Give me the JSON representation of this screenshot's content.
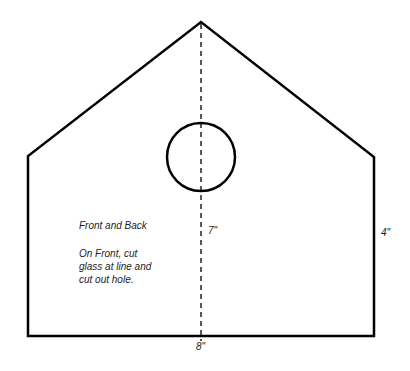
{
  "diagram": {
    "shape": {
      "outline_points": [
        [
          28,
          336
        ],
        [
          28,
          156
        ],
        [
          201,
          22
        ],
        [
          374,
          157
        ],
        [
          374,
          336
        ]
      ],
      "stroke": "#000000"
    },
    "hole": {
      "cx": 201,
      "cy": 157,
      "r": 34
    },
    "center_line": {
      "x": 201,
      "y1": 22,
      "y2": 340,
      "style": "dashed"
    },
    "labels": {
      "panel_name": "Front and Back",
      "instruction_line1": "On Front, cut",
      "instruction_line2": "glass at line and",
      "instruction_line3": "cut out hole.",
      "height_center": "7\"",
      "height_side": "4\"",
      "width_bottom": "8\""
    }
  }
}
